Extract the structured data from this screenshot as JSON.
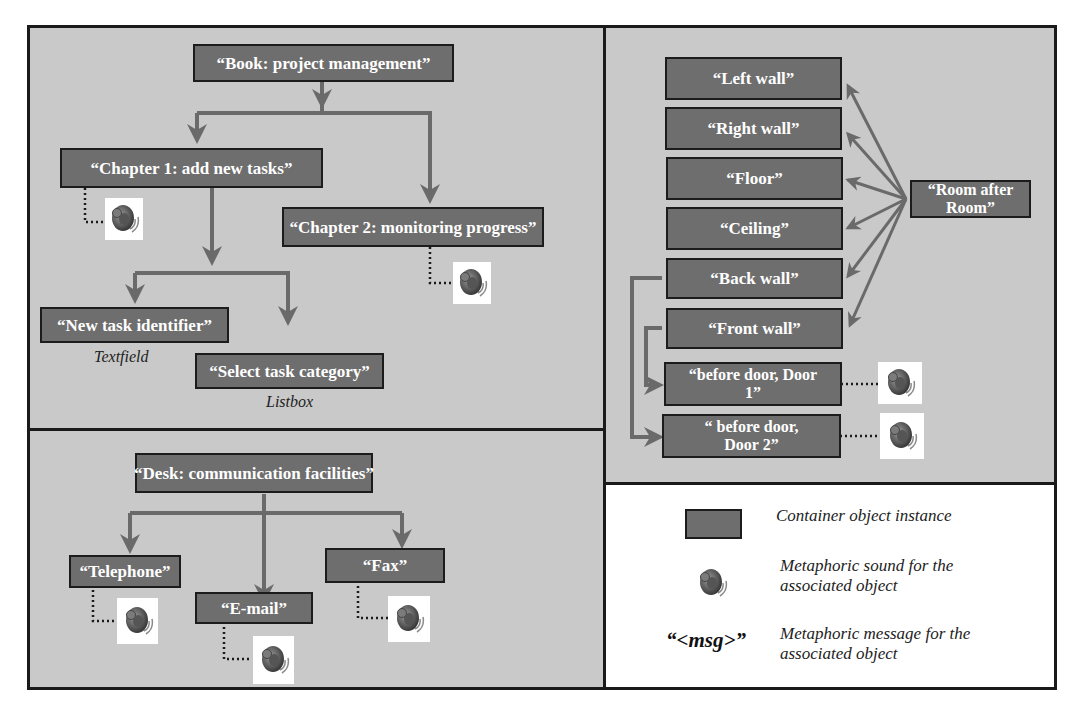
{
  "colors": {
    "panel_bg": "#c9c9c9",
    "box_fill": "#6e6e6e",
    "box_border": "#1c1c1c",
    "box_text": "#ffffff",
    "arrow": "#6a6a6a",
    "frame": "#1a1a1a"
  },
  "book_panel": {
    "root": "“Book: project management”",
    "chapter1": "“Chapter 1: add new tasks”",
    "chapter2": "“Chapter 2: monitoring progress”",
    "task_id": "“New task identifier”",
    "task_id_caption": "Textfield",
    "task_cat": "“Select task category”",
    "task_cat_caption": "Listbox"
  },
  "desk_panel": {
    "root": "“Desk: communication facilities”",
    "telephone": "“Telephone”",
    "email": "“E-mail”",
    "fax": "“Fax”"
  },
  "room_panel": {
    "root": "“Room after Room”",
    "items": [
      "“Left wall”",
      "“Right wall”",
      "“Floor”",
      "“Ceiling”",
      "“Back wall”",
      "“Front wall”"
    ],
    "door1": "“before door, Door 1”",
    "door2": "“ before door, Door 2”"
  },
  "legend": {
    "container_label": "Container object instance",
    "sound_label_line1": "Metaphoric sound for the",
    "sound_label_line2": "associated object",
    "msg_symbol": "“<msg>”",
    "msg_label_line1": "Metaphoric message for the",
    "msg_label_line2": "associated object"
  },
  "icons": {
    "sound": "speaker-icon"
  }
}
